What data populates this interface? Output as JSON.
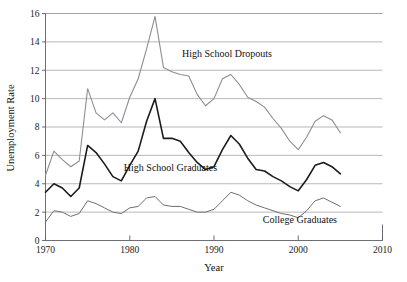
{
  "figure": {
    "clipped_header_text": "",
    "background": "#ffffff"
  },
  "chart_data": {
    "type": "line",
    "title": "",
    "xlabel": "Year",
    "ylabel": "Unemployment Rate",
    "xlim": [
      1970,
      2010
    ],
    "ylim": [
      0,
      16
    ],
    "xticks": [
      1970,
      1980,
      1990,
      2000,
      2010
    ],
    "yticks": [
      0,
      2,
      4,
      6,
      8,
      10,
      12,
      14,
      16
    ],
    "grid": "horizontal",
    "legend_position": "inline-annotations",
    "x": [
      1970,
      1971,
      1972,
      1973,
      1974,
      1975,
      1976,
      1977,
      1978,
      1979,
      1980,
      1981,
      1982,
      1983,
      1984,
      1985,
      1986,
      1987,
      1988,
      1989,
      1990,
      1991,
      1992,
      1993,
      1994,
      1995,
      1996,
      1997,
      1998,
      1999,
      2000,
      2001,
      2002,
      2003,
      2004,
      2005
    ],
    "series": [
      {
        "name": "High School Dropouts",
        "color": "#8d8d95",
        "width": 1.1,
        "label_x": 1986.2,
        "label_y": 12.9,
        "values": [
          4.6,
          6.3,
          5.7,
          5.2,
          5.6,
          10.7,
          9.0,
          8.5,
          9.0,
          8.3,
          10.1,
          11.4,
          13.5,
          15.8,
          12.2,
          11.9,
          11.7,
          11.6,
          10.3,
          9.5,
          10.0,
          11.4,
          11.7,
          11.0,
          10.1,
          9.8,
          9.4,
          8.6,
          7.9,
          7.0,
          6.4,
          7.3,
          8.4,
          8.8,
          8.5,
          7.6
        ]
      },
      {
        "name": "High School Graduates",
        "color": "#1c1c1c",
        "width": 1.6,
        "label_x": 1979.3,
        "label_y": 4.9,
        "values": [
          3.4,
          4.0,
          3.7,
          3.1,
          3.7,
          6.7,
          6.2,
          5.4,
          4.5,
          4.2,
          5.3,
          6.3,
          8.4,
          10.0,
          7.2,
          7.2,
          7.0,
          6.2,
          5.5,
          5.0,
          5.2,
          6.4,
          7.4,
          6.8,
          5.8,
          5.0,
          4.9,
          4.5,
          4.2,
          3.8,
          3.5,
          4.3,
          5.3,
          5.5,
          5.2,
          4.7
        ]
      },
      {
        "name": "College Graduates",
        "color": "#6e6e77",
        "width": 1.0,
        "label_x": 1995.8,
        "label_y": 1.2,
        "values": [
          1.3,
          2.1,
          2.0,
          1.7,
          1.9,
          2.8,
          2.6,
          2.3,
          2.0,
          1.9,
          2.3,
          2.4,
          3.0,
          3.1,
          2.5,
          2.4,
          2.4,
          2.2,
          2.0,
          2.0,
          2.2,
          2.8,
          3.4,
          3.2,
          2.8,
          2.5,
          2.3,
          2.1,
          1.9,
          1.8,
          1.6,
          2.1,
          2.8,
          3.0,
          2.7,
          2.4
        ]
      }
    ]
  }
}
